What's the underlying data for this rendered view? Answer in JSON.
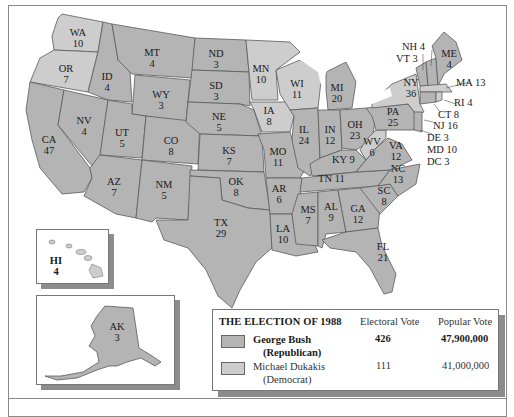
{
  "legend": {
    "title": "THE ELECTION OF 1988",
    "col_electoral": "Electoral Vote",
    "col_popular": "Popular Vote",
    "candidates": [
      {
        "name": "George Bush",
        "party": "(Republican)",
        "electoral": "426",
        "popular": "47,900,000",
        "color": "#b4b4b4"
      },
      {
        "name": "Michael Dukakis",
        "party": "(Democrat)",
        "electoral": "111",
        "popular": "41,000,000",
        "color": "#cdcdcd"
      }
    ]
  },
  "states": {
    "WA": {
      "abbr": "WA",
      "ev": "10",
      "winner": "D"
    },
    "OR": {
      "abbr": "OR",
      "ev": "7",
      "winner": "D"
    },
    "CA": {
      "abbr": "CA",
      "ev": "47",
      "winner": "R"
    },
    "NV": {
      "abbr": "NV",
      "ev": "4",
      "winner": "R"
    },
    "ID": {
      "abbr": "ID",
      "ev": "4",
      "winner": "R"
    },
    "MT": {
      "abbr": "MT",
      "ev": "4",
      "winner": "R"
    },
    "WY": {
      "abbr": "WY",
      "ev": "3",
      "winner": "R"
    },
    "UT": {
      "abbr": "UT",
      "ev": "5",
      "winner": "R"
    },
    "AZ": {
      "abbr": "AZ",
      "ev": "7",
      "winner": "R"
    },
    "CO": {
      "abbr": "CO",
      "ev": "8",
      "winner": "R"
    },
    "NM": {
      "abbr": "NM",
      "ev": "5",
      "winner": "R"
    },
    "ND": {
      "abbr": "ND",
      "ev": "3",
      "winner": "R"
    },
    "SD": {
      "abbr": "SD",
      "ev": "3",
      "winner": "R"
    },
    "NE": {
      "abbr": "NE",
      "ev": "5",
      "winner": "R"
    },
    "KS": {
      "abbr": "KS",
      "ev": "7",
      "winner": "R"
    },
    "OK": {
      "abbr": "OK",
      "ev": "8",
      "winner": "R"
    },
    "TX": {
      "abbr": "TX",
      "ev": "29",
      "winner": "R"
    },
    "MN": {
      "abbr": "MN",
      "ev": "10",
      "winner": "D"
    },
    "IA": {
      "abbr": "IA",
      "ev": "8",
      "winner": "D"
    },
    "MO": {
      "abbr": "MO",
      "ev": "11",
      "winner": "R"
    },
    "AR": {
      "abbr": "AR",
      "ev": "6",
      "winner": "R"
    },
    "LA": {
      "abbr": "LA",
      "ev": "10",
      "winner": "R"
    },
    "WI": {
      "abbr": "WI",
      "ev": "11",
      "winner": "D"
    },
    "IL": {
      "abbr": "IL",
      "ev": "24",
      "winner": "R"
    },
    "MI": {
      "abbr": "MI",
      "ev": "20",
      "winner": "R"
    },
    "IN": {
      "abbr": "IN",
      "ev": "12",
      "winner": "R"
    },
    "OH": {
      "abbr": "OH",
      "ev": "23",
      "winner": "R"
    },
    "KY": {
      "abbr": "KY",
      "ev": "9",
      "winner": "R"
    },
    "TN": {
      "abbr": "TN",
      "ev": "11",
      "winner": "R"
    },
    "MS": {
      "abbr": "MS",
      "ev": "7",
      "winner": "R"
    },
    "AL": {
      "abbr": "AL",
      "ev": "9",
      "winner": "R"
    },
    "GA": {
      "abbr": "GA",
      "ev": "12",
      "winner": "R"
    },
    "FL": {
      "abbr": "FL",
      "ev": "21",
      "winner": "R"
    },
    "SC": {
      "abbr": "SC",
      "ev": "8",
      "winner": "R"
    },
    "NC": {
      "abbr": "NC",
      "ev": "13",
      "winner": "R"
    },
    "VA": {
      "abbr": "VA",
      "ev": "12",
      "winner": "R"
    },
    "WV": {
      "abbr": "WV",
      "ev": "6",
      "winner": "D"
    },
    "PA": {
      "abbr": "PA",
      "ev": "25",
      "winner": "R"
    },
    "NY": {
      "abbr": "NY",
      "ev": "36",
      "winner": "D"
    },
    "ME": {
      "abbr": "ME",
      "ev": "4",
      "winner": "R"
    },
    "HI": {
      "abbr": "HI",
      "ev": "4",
      "winner": "D"
    },
    "AK": {
      "abbr": "AK",
      "ev": "3",
      "winner": "R"
    }
  },
  "callouts": {
    "NH": "NH 4",
    "VT": "VT 3",
    "MA": "MA 13",
    "RI": "RI 4",
    "CT": "CT 8",
    "NJ": "NJ 16",
    "DE": "DE 3",
    "MD": "MD 10",
    "DC": "DC 3"
  }
}
